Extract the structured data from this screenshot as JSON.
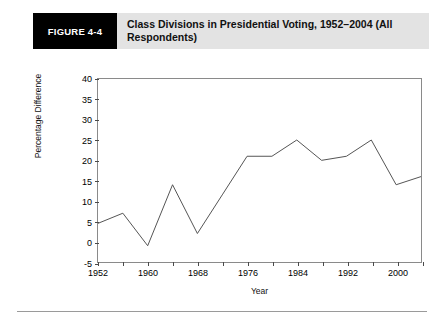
{
  "figure": {
    "number_label": "FIGURE 4-4",
    "title": "Class Divisions in Presidential Voting, 1952–2004 (All Respondents)"
  },
  "chart_data": {
    "type": "line",
    "title": "Class Divisions in Presidential Voting, 1952–2004 (All Respondents)",
    "xlabel": "Year",
    "ylabel": "Percentage Difference",
    "x": [
      1952,
      1956,
      1960,
      1964,
      1968,
      1972,
      1976,
      1980,
      1984,
      1988,
      1992,
      1996,
      2000,
      2004
    ],
    "values": [
      4.5,
      7,
      -1,
      14,
      2,
      11.5,
      21,
      21,
      25,
      20,
      21,
      25,
      14,
      16
    ],
    "xlim": [
      1952,
      2004
    ],
    "ylim": [
      -5,
      40
    ],
    "yticks": [
      40,
      35,
      30,
      25,
      20,
      15,
      10,
      5,
      0,
      -5
    ],
    "ytick_labels": [
      "40",
      "35",
      "30",
      "25",
      "20",
      "15",
      "10",
      "5",
      "0",
      "-5"
    ],
    "xticks": [
      1952,
      1956,
      1960,
      1964,
      1968,
      1972,
      1976,
      1980,
      1984,
      1988,
      1992,
      1996,
      2000,
      2004
    ],
    "xtick_labels": [
      "1952",
      "",
      "1960",
      "",
      "1968",
      "",
      "1976",
      "",
      "1984",
      "",
      "1992",
      "",
      "2000",
      ""
    ],
    "labeled_xticks": [
      1952,
      1960,
      1968,
      1976,
      1984,
      1992,
      2000
    ],
    "grid": false,
    "legend": false,
    "line_color": "#555555",
    "line_width": 1,
    "frame_color": "#8a8a8a",
    "background": "#ffffff"
  },
  "colors": {
    "header_box_background": "#000000",
    "header_box_text": "#ffffff",
    "header_band_background": "#e3e3e3",
    "page_background": "#ffffff",
    "footer_rule": "#9a9a9a"
  }
}
